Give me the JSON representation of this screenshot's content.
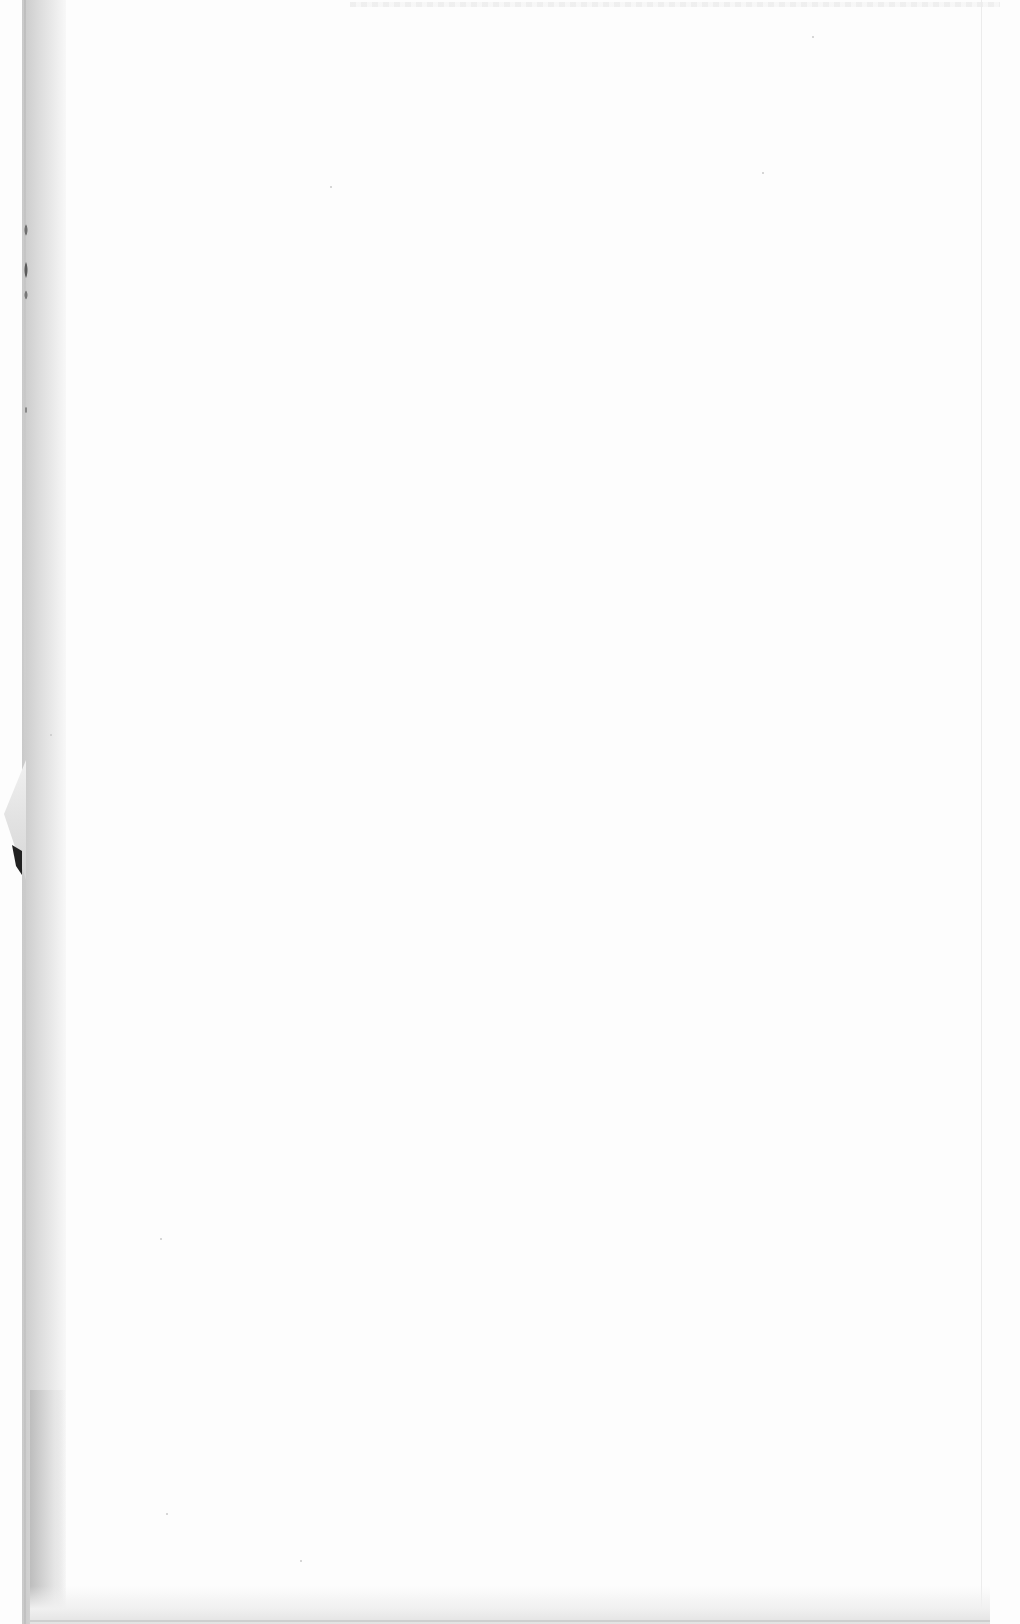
{
  "document": {
    "type": "scanned-page",
    "state": "blank",
    "text": ""
  },
  "colors": {
    "paper": "#fdfdfd",
    "gutter": "#d2d2d2",
    "edge_shadow": "#bdbdbd"
  }
}
